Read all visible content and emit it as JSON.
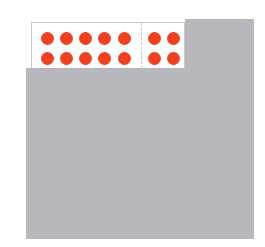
{
  "diagram": {
    "type": "ten-frame-with-block",
    "colors": {
      "dot": "#f04020",
      "block": "#b8b8bc",
      "frame_border": "#c8c8cc",
      "frame_bg": "#ffffff"
    },
    "frame": {
      "left_section": {
        "columns": 5,
        "rows": 2,
        "dot_count": 10
      },
      "right_section": {
        "columns": 2,
        "rows": 2,
        "dot_count": 4
      },
      "total_dots": 14
    },
    "dots": [
      {
        "x": 15,
        "y": 15
      },
      {
        "x": 34,
        "y": 15
      },
      {
        "x": 53,
        "y": 15
      },
      {
        "x": 72,
        "y": 15
      },
      {
        "x": 92,
        "y": 15
      },
      {
        "x": 15,
        "y": 35
      },
      {
        "x": 34,
        "y": 35
      },
      {
        "x": 53,
        "y": 35
      },
      {
        "x": 72,
        "y": 35
      },
      {
        "x": 92,
        "y": 35
      },
      {
        "x": 122,
        "y": 15
      },
      {
        "x": 141,
        "y": 15
      },
      {
        "x": 122,
        "y": 35
      },
      {
        "x": 141,
        "y": 35
      }
    ]
  }
}
